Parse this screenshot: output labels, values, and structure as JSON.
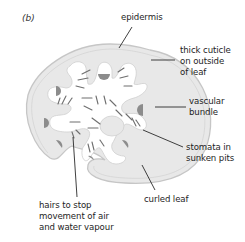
{
  "figure": {
    "panel_label": "(b)"
  },
  "labels": {
    "epidermis": "epidermis",
    "cuticle": [
      "thick cuticle",
      "on outside",
      "of leaf"
    ],
    "vascular": [
      "vascular",
      "bundle"
    ],
    "stomata": [
      "stomata in",
      "sunken pits"
    ],
    "curled": "curled leaf",
    "hairs": [
      "hairs to stop",
      "movement of air",
      "and water vapour"
    ]
  },
  "colors": {
    "tissue_fill": "#e8e8e8",
    "tissue_outline": "#c9c9c9",
    "cavity_fill": "#ffffff",
    "vascular_fill": "#8c8c8c",
    "hair_stroke": "#6e6e6e",
    "leader_line": "#2a2a2a"
  }
}
